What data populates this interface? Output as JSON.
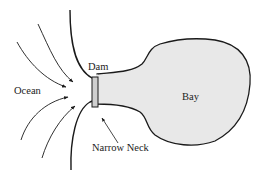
{
  "diagram": {
    "labels": {
      "ocean": "Ocean",
      "dam": "Dam",
      "bay": "Bay",
      "narrow_neck": "Narrow Neck"
    },
    "colors": {
      "line": "#1a1a1a",
      "bay_fill": "#e8e8e8",
      "dam_fill": "#cfcfcf"
    }
  }
}
